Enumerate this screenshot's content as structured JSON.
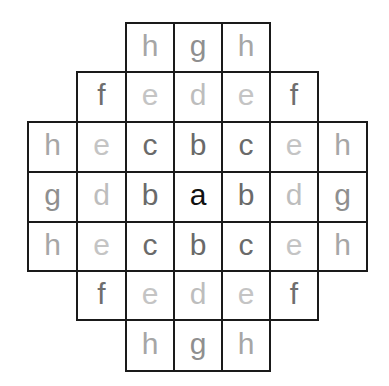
{
  "diagram": {
    "title": "",
    "cell_size_px": 49,
    "origin": {
      "x": 27,
      "y": 22
    },
    "colors": {
      "a": "#111111",
      "b": "#6a6a6a",
      "c": "#6a6a6a",
      "d": "#bdbdbd",
      "e": "#c4c4c4",
      "f": "#6e6e6e",
      "g": "#8f8f8f",
      "h": "#a6a6a6",
      "border": "#1a1a1a"
    },
    "rows": [
      [
        null,
        null,
        "h",
        "g",
        "h",
        null,
        null
      ],
      [
        null,
        "f",
        "e",
        "d",
        "e",
        "f",
        null
      ],
      [
        "h",
        "e",
        "c",
        "b",
        "c",
        "e",
        "h"
      ],
      [
        "g",
        "d",
        "b",
        "a",
        "b",
        "d",
        "g"
      ],
      [
        "h",
        "e",
        "c",
        "b",
        "c",
        "e",
        "h"
      ],
      [
        null,
        "f",
        "e",
        "d",
        "e",
        "f",
        null
      ],
      [
        null,
        null,
        "h",
        "g",
        "h",
        null,
        null
      ]
    ]
  }
}
